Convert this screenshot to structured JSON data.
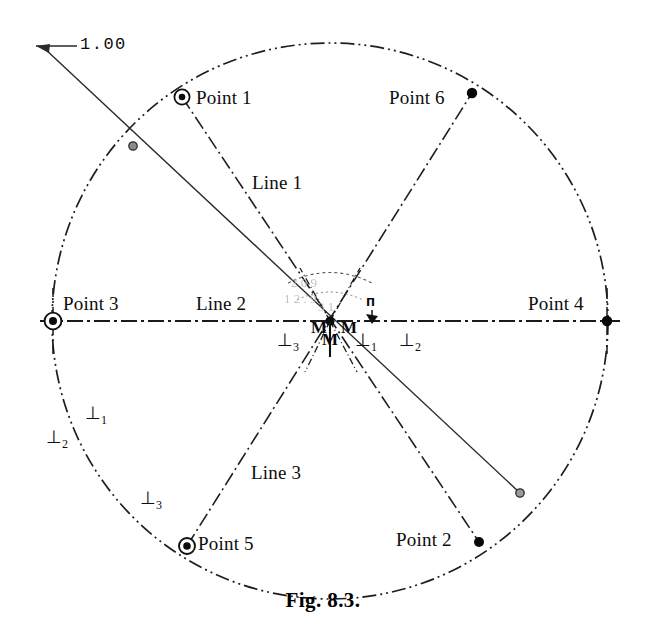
{
  "figure": {
    "caption": "Fig. 8.3.",
    "dimension_label": "1.00",
    "background_color": "#ffffff",
    "ink_color": "#111111"
  },
  "geometry": {
    "circle": {
      "cx": 330,
      "cy": 321,
      "r": 278,
      "style": "dash-dot-dot"
    },
    "center": {
      "x": 330,
      "y": 321
    }
  },
  "points": [
    {
      "id": "point1",
      "label": "Point 1",
      "marker": "circled-dot",
      "x": 182,
      "y": 97,
      "label_x": 196,
      "label_y": 88
    },
    {
      "id": "point2",
      "label": "Point 2",
      "marker": "solid-dot",
      "x": 479,
      "y": 542,
      "label_x": 396,
      "label_y": 530
    },
    {
      "id": "point3",
      "label": "Point 3",
      "marker": "circled-dot",
      "x": 53,
      "y": 321,
      "label_x": 63,
      "label_y": 294
    },
    {
      "id": "point4",
      "label": "Point 4",
      "marker": "solid-dot",
      "x": 607,
      "y": 321,
      "label_x": 528,
      "label_y": 294
    },
    {
      "id": "point5",
      "label": "Point 5",
      "marker": "circled-dot",
      "x": 187,
      "y": 546,
      "label_x": 198,
      "label_y": 534
    },
    {
      "id": "point6",
      "label": "Point 6",
      "marker": "solid-dot",
      "x": 472,
      "y": 93,
      "label_x": 389,
      "label_y": 88
    }
  ],
  "lines": [
    {
      "id": "line1",
      "label": "Line 1",
      "label_x": 252,
      "label_y": 173
    },
    {
      "id": "line2",
      "label": "Line 2",
      "label_x": 196,
      "label_y": 294
    },
    {
      "id": "line3",
      "label": "Line 3",
      "label_x": 251,
      "label_y": 463
    }
  ],
  "constraints": {
    "perpendicular": [
      {
        "id": "perp-lower-left-2",
        "symbol": "⊥",
        "sub": "2",
        "x": 46,
        "y": 428
      },
      {
        "id": "perp-lower-left-1",
        "symbol": "⊥",
        "sub": "1",
        "x": 85,
        "y": 404
      },
      {
        "id": "perp-lower-left-3",
        "symbol": "⊥",
        "sub": "3",
        "x": 140,
        "y": 489
      },
      {
        "id": "perp-center-3",
        "symbol": "⊥",
        "sub": "3",
        "x": 277,
        "y": 331
      },
      {
        "id": "perp-center-1",
        "symbol": "⊥",
        "sub": "1",
        "x": 355,
        "y": 331
      },
      {
        "id": "perp-center-2",
        "symbol": "⊥",
        "sub": "2",
        "x": 399,
        "y": 331
      }
    ],
    "midpoint_marks": [
      {
        "id": "midpoint-mark-a",
        "symbol": "M",
        "x": 311,
        "y": 319
      },
      {
        "id": "midpoint-mark-b",
        "symbol": "M",
        "x": 322,
        "y": 331
      },
      {
        "id": "midpoint-mark-c",
        "symbol": "M",
        "x": 341,
        "y": 319
      }
    ],
    "parallel_marks": [
      {
        "id": "parallel-mark-a",
        "symbol": "п",
        "x": 366,
        "y": 293
      }
    ]
  },
  "overlap_artifacts": [
    {
      "id": "smudge-a",
      "text": "2 0 9",
      "x": 291,
      "y": 276
    },
    {
      "id": "smudge-b",
      "text": "1 2 . 9",
      "x": 284,
      "y": 292
    },
    {
      "id": "smudge-c",
      "text": "3 1",
      "x": 318,
      "y": 300
    }
  ]
}
